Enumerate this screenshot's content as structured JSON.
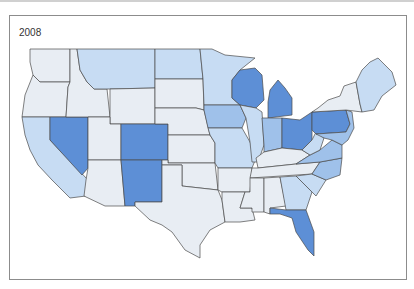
{
  "map": {
    "year_label": "2008",
    "colors": {
      "none": "#e8edf3",
      "light": "#c7dcf3",
      "medium": "#9fc1ea",
      "dark": "#5d8fd6",
      "border": "#4a4a4a"
    },
    "regions": [
      {
        "name": "Washington",
        "shade": "none"
      },
      {
        "name": "Oregon",
        "shade": "none"
      },
      {
        "name": "California",
        "shade": "light"
      },
      {
        "name": "Nevada",
        "shade": "dark"
      },
      {
        "name": "Idaho",
        "shade": "none"
      },
      {
        "name": "Montana",
        "shade": "light"
      },
      {
        "name": "Wyoming",
        "shade": "none"
      },
      {
        "name": "Utah",
        "shade": "none"
      },
      {
        "name": "Colorado",
        "shade": "dark"
      },
      {
        "name": "Arizona",
        "shade": "none"
      },
      {
        "name": "New Mexico",
        "shade": "dark"
      },
      {
        "name": "North Dakota",
        "shade": "light"
      },
      {
        "name": "South Dakota",
        "shade": "none"
      },
      {
        "name": "Nebraska",
        "shade": "none"
      },
      {
        "name": "Kansas",
        "shade": "none"
      },
      {
        "name": "Oklahoma",
        "shade": "none"
      },
      {
        "name": "Texas",
        "shade": "none"
      },
      {
        "name": "Minnesota",
        "shade": "light"
      },
      {
        "name": "Iowa",
        "shade": "medium"
      },
      {
        "name": "Missouri",
        "shade": "light"
      },
      {
        "name": "Arkansas",
        "shade": "none"
      },
      {
        "name": "Louisiana",
        "shade": "none"
      },
      {
        "name": "Wisconsin",
        "shade": "dark"
      },
      {
        "name": "Illinois",
        "shade": "light"
      },
      {
        "name": "Michigan",
        "shade": "dark"
      },
      {
        "name": "Indiana",
        "shade": "medium"
      },
      {
        "name": "Ohio",
        "shade": "dark"
      },
      {
        "name": "Kentucky",
        "shade": "none"
      },
      {
        "name": "Tennessee",
        "shade": "none"
      },
      {
        "name": "Mississippi",
        "shade": "none"
      },
      {
        "name": "Alabama",
        "shade": "none"
      },
      {
        "name": "Georgia",
        "shade": "light"
      },
      {
        "name": "Florida",
        "shade": "dark"
      },
      {
        "name": "South Carolina",
        "shade": "light"
      },
      {
        "name": "North Carolina",
        "shade": "medium"
      },
      {
        "name": "Virginia",
        "shade": "medium"
      },
      {
        "name": "West Virginia",
        "shade": "light"
      },
      {
        "name": "Pennsylvania",
        "shade": "dark"
      },
      {
        "name": "New York",
        "shade": "none"
      },
      {
        "name": "New England",
        "shade": "light"
      }
    ]
  }
}
